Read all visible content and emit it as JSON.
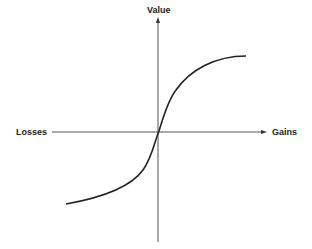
{
  "diagram": {
    "y_axis_label": "Value",
    "x_axis_left_label": "Losses",
    "x_axis_right_label": "Gains",
    "curve_color": "#222222",
    "axis_color": "#555555"
  }
}
